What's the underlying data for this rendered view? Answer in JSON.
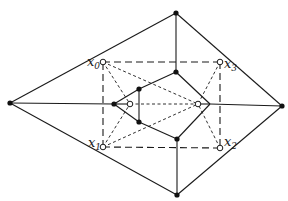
{
  "diagram": {
    "labels": {
      "x0": {
        "base": "x",
        "sub": "0"
      },
      "x1": {
        "base": "x",
        "sub": "1"
      },
      "x2": {
        "base": "x",
        "sub": "2"
      },
      "x3": {
        "base": "x",
        "sub": "3"
      }
    },
    "colors": {
      "stroke": "#1a1a1a",
      "background": "#ffffff"
    }
  }
}
